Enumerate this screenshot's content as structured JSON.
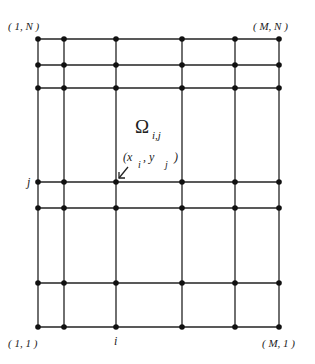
{
  "diagram": {
    "type": "computational-grid",
    "columns_x": [
      38,
      64,
      116,
      182,
      235,
      279
    ],
    "rows_y": [
      39,
      65,
      88,
      182,
      208,
      283,
      327
    ],
    "corner_labels": {
      "top_left": "( 1, N )",
      "top_right": "( M, N )",
      "bottom_left": "( 1, 1 )",
      "bottom_right": "( M, 1 )"
    },
    "axis_labels": {
      "row_j": "j",
      "column_i": "i"
    },
    "cell_label": {
      "symbol": "Ω",
      "subscript": "i,j"
    },
    "point_label": {
      "open": "(x",
      "sub_i": "i",
      "comma": " , y",
      "sub_j": "j",
      "close": ")"
    },
    "colors": {
      "line": "#222222",
      "node": "#111111",
      "background": "#ffffff"
    }
  }
}
